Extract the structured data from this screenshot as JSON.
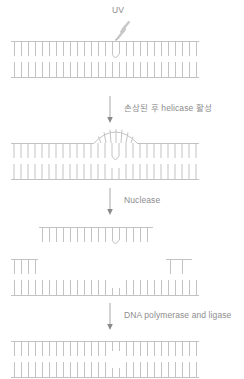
{
  "diagram": {
    "stroke_color": "#b9b9b9",
    "text_color": "#8d8d8d",
    "background": "#ffffff"
  },
  "labels": {
    "uv": "UV",
    "step1": "손상된 후 helicase 활성",
    "step2": "Nuclease",
    "step3": "DNA polymerase and ligase"
  },
  "stages": [
    {
      "name": "damaged-duplex",
      "caption": "UV-damaged DNA duplex with thymine dimer",
      "rungs_top": 26,
      "rungs_bottom": 26,
      "lesion": "thymine-dimer-v"
    },
    {
      "name": "helicase-bubble-duplex",
      "caption": "Helicase opens a bubble around the lesion",
      "rungs_top": 26,
      "rungs_bottom": 26,
      "lesion": "thymine-dimer-v",
      "bubble": "arc"
    },
    {
      "name": "excised-fragment",
      "caption": "Nuclease-excised oligonucleotide carrying the dimer",
      "rungs": 14,
      "lesion": "thymine-dimer-v"
    },
    {
      "name": "gapped-duplex",
      "caption": "Gapped duplex after excision",
      "rungs_top_left": 4,
      "rungs_top_right": 2,
      "rungs_bottom": 20
    },
    {
      "name": "repaired-duplex",
      "caption": "Repaired DNA duplex after synthesis and ligation",
      "rungs_top": 26,
      "rungs_bottom": 26,
      "lesion": "none"
    }
  ],
  "arrows": [
    {
      "name": "arrow-to-helicase",
      "label_ref": "step1"
    },
    {
      "name": "arrow-to-nuclease",
      "label_ref": "step2"
    },
    {
      "name": "arrow-to-repair",
      "label_ref": "step3"
    }
  ]
}
